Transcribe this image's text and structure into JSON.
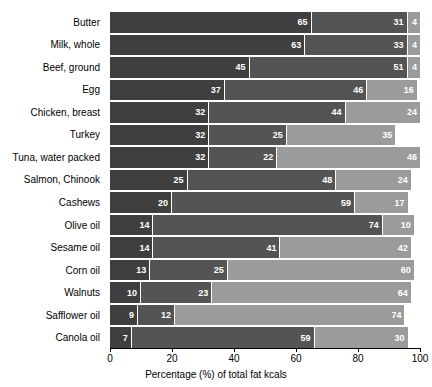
{
  "chart_data": {
    "type": "bar",
    "orientation": "horizontal",
    "stacked": true,
    "title": "",
    "xlabel": "Percentage (%) of total fat kcals",
    "ylabel": "",
    "xlim": [
      0,
      100
    ],
    "xticks": [
      0,
      20,
      40,
      60,
      80,
      100
    ],
    "grid": false,
    "legend": "none",
    "categories": [
      "Butter",
      "Milk, whole",
      "Beef, ground",
      "Egg",
      "Chicken, breast",
      "Turkey",
      "Tuna, water packed",
      "Salmon, Chinook",
      "Cashews",
      "Olive oil",
      "Sesame oil",
      "Corn oil",
      "Walnuts",
      "Safflower oil",
      "Canola oil"
    ],
    "series": [
      {
        "name": "segment-1",
        "color": "#3f3f3f",
        "values": [
          65,
          63,
          45,
          37,
          32,
          32,
          32,
          25,
          20,
          14,
          14,
          13,
          10,
          9,
          7
        ]
      },
      {
        "name": "segment-2",
        "color": "#545454",
        "values": [
          31,
          33,
          51,
          46,
          44,
          25,
          22,
          48,
          59,
          74,
          41,
          25,
          23,
          12,
          59
        ]
      },
      {
        "name": "segment-3",
        "color": "#9b9b9b",
        "values": [
          4,
          4,
          4,
          16,
          24,
          35,
          46,
          24,
          17,
          10,
          42,
          60,
          64,
          74,
          30
        ]
      }
    ],
    "rows": [
      {
        "label": "Butter",
        "segments": [
          65,
          31,
          4
        ]
      },
      {
        "label": "Milk, whole",
        "segments": [
          63,
          33,
          4
        ]
      },
      {
        "label": "Beef, ground",
        "segments": [
          45,
          51,
          4
        ]
      },
      {
        "label": "Egg",
        "segments": [
          37,
          46,
          16
        ]
      },
      {
        "label": "Chicken, breast",
        "segments": [
          32,
          44,
          24
        ]
      },
      {
        "label": "Turkey",
        "segments": [
          32,
          25,
          35
        ]
      },
      {
        "label": "Tuna, water packed",
        "segments": [
          32,
          22,
          46
        ]
      },
      {
        "label": "Salmon, Chinook",
        "segments": [
          25,
          48,
          24
        ]
      },
      {
        "label": "Cashews",
        "segments": [
          20,
          59,
          17
        ]
      },
      {
        "label": "Olive oil",
        "segments": [
          14,
          74,
          10
        ]
      },
      {
        "label": "Sesame oil",
        "segments": [
          14,
          41,
          42
        ]
      },
      {
        "label": "Corn oil",
        "segments": [
          13,
          25,
          60
        ]
      },
      {
        "label": "Walnuts",
        "segments": [
          10,
          23,
          64
        ]
      },
      {
        "label": "Safflower oil",
        "segments": [
          9,
          12,
          74
        ]
      },
      {
        "label": "Canola oil",
        "segments": [
          7,
          59,
          30
        ]
      }
    ]
  }
}
